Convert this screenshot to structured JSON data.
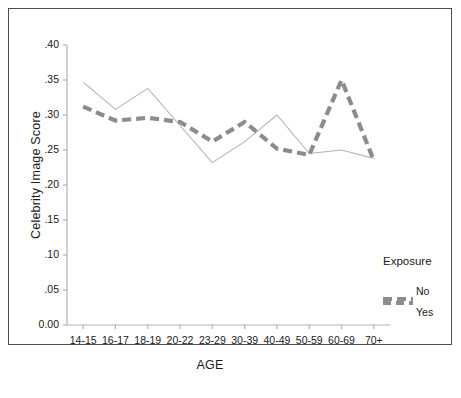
{
  "chart_data": {
    "type": "line",
    "title": "",
    "xlabel": "AGE",
    "ylabel": "Celebrity Image Score",
    "categories": [
      "14-15",
      "16-17",
      "18-19",
      "20-22",
      "23-29",
      "30-39",
      "40-49",
      "50-59",
      "60-69",
      "70+"
    ],
    "ylim": [
      0.0,
      0.4
    ],
    "ytick_labels": [
      "0.00",
      ".05",
      ".10",
      ".15",
      ".20",
      ".25",
      ".30",
      ".35",
      ".40"
    ],
    "ytick_values": [
      0.0,
      0.05,
      0.1,
      0.15,
      0.2,
      0.25,
      0.3,
      0.35,
      0.4
    ],
    "grid": false,
    "legend_position": "right",
    "series": [
      {
        "name": "No",
        "style": "thin-solid",
        "color": "#b3b3b3",
        "values": [
          0.347,
          0.308,
          0.338,
          0.285,
          0.232,
          0.262,
          0.3,
          0.245,
          0.25,
          0.238
        ]
      },
      {
        "name": "Yes",
        "style": "thick-dashed",
        "color": "#8c8c8c",
        "values": [
          0.312,
          0.292,
          0.296,
          0.29,
          0.262,
          0.29,
          0.252,
          0.243,
          0.35,
          0.235
        ]
      }
    ]
  },
  "legend": {
    "title": "Exposure",
    "entries": [
      {
        "label": "No",
        "swatch": "thin"
      },
      {
        "label": "Yes",
        "swatch": "dashed"
      }
    ]
  },
  "colors": {
    "frame": "#4d4d4d",
    "axis": "#b3b3b3",
    "series_no": "#b3b3b3",
    "series_yes": "#8c8c8c",
    "text": "#1a1a1a",
    "background": "#ffffff"
  }
}
